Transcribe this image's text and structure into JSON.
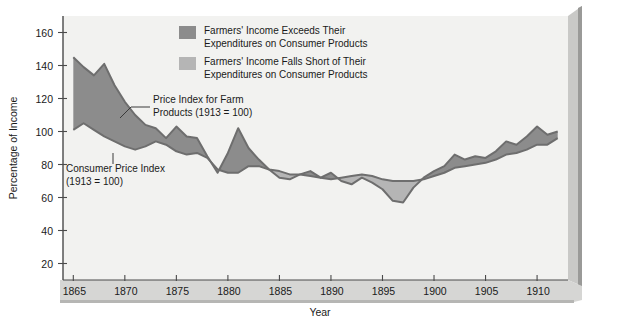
{
  "chart_data": {
    "type": "area",
    "title": "",
    "xlabel": "Year",
    "ylabel": "Percentage of Income",
    "xlim": [
      1864,
      1913
    ],
    "ylim": [
      10,
      170
    ],
    "grid": false,
    "legend_position": "top-center",
    "x_ticks": [
      "1865",
      "1870",
      "1875",
      "1880",
      "1885",
      "1890",
      "1895",
      "1900",
      "1905",
      "1910"
    ],
    "x_tick_values": [
      1865,
      1870,
      1875,
      1880,
      1885,
      1890,
      1895,
      1900,
      1905,
      1910
    ],
    "y_ticks": [
      "20",
      "40",
      "60",
      "80",
      "100",
      "120",
      "140",
      "160"
    ],
    "y_tick_values": [
      20,
      40,
      60,
      80,
      100,
      120,
      140,
      160
    ],
    "x": [
      1865,
      1866,
      1867,
      1868,
      1869,
      1870,
      1871,
      1872,
      1873,
      1874,
      1875,
      1876,
      1877,
      1878,
      1879,
      1880,
      1881,
      1882,
      1883,
      1884,
      1885,
      1886,
      1887,
      1888,
      1889,
      1890,
      1891,
      1892,
      1893,
      1894,
      1895,
      1896,
      1897,
      1898,
      1899,
      1900,
      1901,
      1902,
      1903,
      1904,
      1905,
      1906,
      1907,
      1908,
      1909,
      1910,
      1911,
      1912
    ],
    "series": [
      {
        "name": "Price Index for Farm Products (1913 = 100)",
        "values": [
          145,
          139,
          134,
          141,
          128,
          118,
          110,
          104,
          102,
          96,
          103,
          97,
          96,
          85,
          75,
          87,
          102,
          90,
          83,
          77,
          72,
          71,
          74,
          76,
          72,
          75,
          70,
          68,
          72,
          69,
          65,
          58,
          57,
          66,
          72,
          76,
          79,
          86,
          83,
          85,
          84,
          88,
          94,
          92,
          97,
          103,
          98,
          100
        ]
      },
      {
        "name": "Consumer Price Index (1913 = 100)",
        "values": [
          101,
          105,
          101,
          97,
          94,
          91,
          89,
          91,
          94,
          92,
          88,
          86,
          87,
          84,
          77,
          75,
          75,
          79,
          79,
          77,
          76,
          74,
          74,
          73,
          72,
          71,
          72,
          73,
          74,
          73,
          71,
          70,
          70,
          70,
          71,
          73,
          75,
          78,
          79,
          80,
          81,
          83,
          86,
          87,
          89,
          92,
          92,
          96
        ]
      }
    ],
    "legend": [
      {
        "label_line1": "Farmers' Income Exceeds Their",
        "label_line2": "Expenditures on Consumer Products",
        "color": "#8c8c8c"
      },
      {
        "label_line1": "Farmers' Income Falls Short of Their",
        "label_line2": "Expenditures on Consumer Products",
        "color": "#b5b5b5"
      }
    ],
    "annotations": [
      {
        "line1": "Price Index for Farm",
        "line2": "Products (1913 = 100)"
      },
      {
        "line1": "Consumer Price Index",
        "line2": "(1913 = 100)"
      }
    ]
  },
  "colors": {
    "plot_background": "#f2f2f0",
    "fill_above": "#8c8c8c",
    "fill_below": "#b5b5b5",
    "line": "#6e6e6e",
    "axis": "#4a4a4a",
    "panel_edge": "#a8a8a8",
    "panel_edge_dark": "#8f8f8f"
  }
}
